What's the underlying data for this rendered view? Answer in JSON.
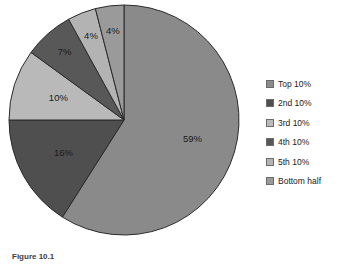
{
  "caption": "Figure 10.1",
  "chart_data": {
    "type": "pie",
    "title": "",
    "start_angle_deg": 0,
    "direction": "clockwise",
    "legend_position": "right",
    "grid": false,
    "categories": [
      "Top 10%",
      "2nd 10%",
      "3rd 10%",
      "4th 10%",
      "5th 10%",
      "Bottom half"
    ],
    "values": [
      59,
      16,
      10,
      7,
      4,
      4
    ],
    "value_labels": [
      "59%",
      "16%",
      "10%",
      "7%",
      "4%",
      "4%"
    ],
    "colors": [
      "#8a8a8a",
      "#4f4f4f",
      "#b9b9b9",
      "#585858",
      "#b3b3b3",
      "#9a9a9a"
    ],
    "slice_border_color": "#2b2b2b"
  },
  "legend": {
    "items": [
      {
        "label": "Top 10%",
        "color": "#8a8a8a"
      },
      {
        "label": "2nd 10%",
        "color": "#4f4f4f"
      },
      {
        "label": "3rd 10%",
        "color": "#b9b9b9"
      },
      {
        "label": "4th 10%",
        "color": "#585858"
      },
      {
        "label": "5th 10%",
        "color": "#b3b3b3"
      },
      {
        "label": "Bottom half",
        "color": "#9a9a9a"
      }
    ]
  }
}
